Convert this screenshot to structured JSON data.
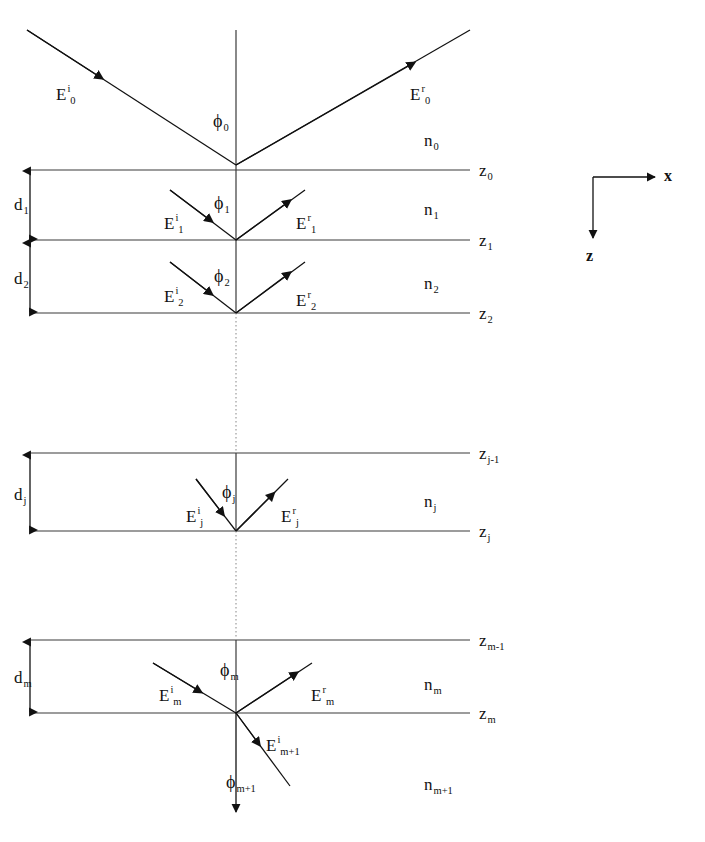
{
  "figure": {
    "background_color": "#ffffff",
    "line_color": "#111111",
    "width": 705,
    "height": 842
  },
  "axes": {
    "x_label": "x",
    "z_label": "z",
    "origin_x": 593,
    "origin_y": 177
  },
  "interfaces": [
    {
      "id": "z0",
      "label_base": "z",
      "label_sub": "0",
      "y": 170
    },
    {
      "id": "z1",
      "label_base": "z",
      "label_sub": "1",
      "y": 240
    },
    {
      "id": "z2",
      "label_base": "z",
      "label_sub": "2",
      "y": 313
    },
    {
      "id": "zjm1",
      "label_base": "z",
      "label_sub": "j-1",
      "y": 453
    },
    {
      "id": "zj",
      "label_base": "z",
      "label_sub": "j",
      "y": 531
    },
    {
      "id": "zmm1",
      "label_base": "z",
      "label_sub": "m-1",
      "y": 640
    },
    {
      "id": "zm",
      "label_base": "z",
      "label_sub": "m",
      "y": 713
    }
  ],
  "media": [
    {
      "id": "n0",
      "label_base": "n",
      "label_sub": "0",
      "x": 424,
      "y": 132
    },
    {
      "id": "n1",
      "label_base": "n",
      "label_sub": "1",
      "x": 424,
      "y": 201
    },
    {
      "id": "n2",
      "label_base": "n",
      "label_sub": "2",
      "x": 424,
      "y": 275
    },
    {
      "id": "nj",
      "label_base": "n",
      "label_sub": "j",
      "x": 424,
      "y": 493
    },
    {
      "id": "nm",
      "label_base": "n",
      "label_sub": "m",
      "x": 424,
      "y": 676
    },
    {
      "id": "nmp1",
      "label_base": "n",
      "label_sub": "m+1",
      "x": 424,
      "y": 776
    }
  ],
  "thicknesses": [
    {
      "id": "d1",
      "label_base": "d",
      "label_sub": "1",
      "x": 14,
      "y": 200,
      "top": 171,
      "bottom": 239
    },
    {
      "id": "d2",
      "label_base": "d",
      "label_sub": "2",
      "x": 14,
      "y": 274,
      "top": 243,
      "bottom": 312
    },
    {
      "id": "dj",
      "label_base": "d",
      "label_sub": "j",
      "x": 14,
      "y": 490,
      "top": 455,
      "bottom": 530
    },
    {
      "id": "dm",
      "label_base": "d",
      "label_sub": "m",
      "x": 14,
      "y": 673,
      "top": 642,
      "bottom": 712
    }
  ],
  "fields": [
    {
      "id": "E0i",
      "label_base": "E",
      "label_sup": "i",
      "label_sub": "0",
      "x": 56,
      "y": 86
    },
    {
      "id": "E0r",
      "label_base": "E",
      "label_sup": "r",
      "label_sub": "0",
      "x": 410,
      "y": 86
    },
    {
      "id": "E1i",
      "label_base": "E",
      "label_sup": "i",
      "label_sub": "1",
      "x": 164,
      "y": 215
    },
    {
      "id": "E1r",
      "label_base": "E",
      "label_sup": "r",
      "label_sub": "1",
      "x": 296,
      "y": 215
    },
    {
      "id": "E2i",
      "label_base": "E",
      "label_sup": "i",
      "label_sub": "2",
      "x": 164,
      "y": 288
    },
    {
      "id": "E2r",
      "label_base": "E",
      "label_sup": "r",
      "label_sub": "2",
      "x": 296,
      "y": 292
    },
    {
      "id": "Eji",
      "label_base": "E",
      "label_sup": "i",
      "label_sub": "j",
      "x": 186,
      "y": 508
    },
    {
      "id": "Ejr",
      "label_base": "E",
      "label_sup": "r",
      "label_sub": "j",
      "x": 281,
      "y": 508
    },
    {
      "id": "Emi",
      "label_base": "E",
      "label_sup": "i",
      "label_sub": "m",
      "x": 159,
      "y": 687
    },
    {
      "id": "Emr",
      "label_base": "E",
      "label_sup": "r",
      "label_sub": "m",
      "x": 311,
      "y": 687
    },
    {
      "id": "Emp1i",
      "label_base": "E",
      "label_sup": "i",
      "label_sub": "m+1",
      "x": 266,
      "y": 737
    }
  ],
  "angles": [
    {
      "id": "phi0",
      "label_base": "ϕ",
      "label_sub": "0",
      "x": 213,
      "y": 117
    },
    {
      "id": "phi1",
      "label_base": "ϕ",
      "label_sub": "1",
      "x": 214,
      "y": 198
    },
    {
      "id": "phi2",
      "label_base": "ϕ",
      "label_sub": "2",
      "x": 214,
      "y": 271
    },
    {
      "id": "phij",
      "label_base": "ϕ",
      "label_sub": "j",
      "x": 222,
      "y": 487
    },
    {
      "id": "phim",
      "label_base": "ϕ",
      "label_sub": "m",
      "x": 220,
      "y": 665
    },
    {
      "id": "phimp1",
      "label_base": "ϕ",
      "label_sub": "m+1",
      "x": 226,
      "y": 777
    }
  ],
  "rays": {
    "incident_top": {
      "from": [
        27,
        30
      ],
      "to": [
        236,
        165
      ]
    },
    "reflected_top": {
      "from": [
        236,
        165
      ],
      "to": [
        470,
        30
      ]
    },
    "layer1_in": {
      "from": [
        170,
        190
      ],
      "to": [
        236,
        240
      ]
    },
    "layer1_out": {
      "from": [
        236,
        240
      ],
      "to": [
        305,
        190
      ]
    },
    "layer2_in": {
      "from": [
        170,
        262
      ],
      "to": [
        236,
        313
      ]
    },
    "layer2_out": {
      "from": [
        236,
        313
      ],
      "to": [
        305,
        262
      ]
    },
    "layerj_in": {
      "from": [
        196,
        479
      ],
      "to": [
        236,
        531
      ]
    },
    "layerj_out": {
      "from": [
        236,
        531
      ],
      "to": [
        288,
        479
      ]
    },
    "layerm_in": {
      "from": [
        153,
        663
      ],
      "to": [
        236,
        713
      ]
    },
    "layerm_out": {
      "from": [
        236,
        713
      ],
      "to": [
        312,
        663
      ]
    },
    "transmitted": {
      "from": [
        236,
        713
      ],
      "to": [
        290,
        786
      ]
    },
    "normal_top": {
      "from": [
        236,
        30
      ],
      "to": [
        236,
        165
      ]
    },
    "normal_bottom": {
      "from": [
        236,
        713
      ],
      "to": [
        236,
        820
      ]
    }
  },
  "geometry": {
    "line_left_x": 30,
    "line_right_x": 470,
    "normal_x": 236,
    "dashed_segments": [
      {
        "from_y": 313,
        "to_y": 453
      },
      {
        "from_y": 531,
        "to_y": 640
      }
    ]
  }
}
